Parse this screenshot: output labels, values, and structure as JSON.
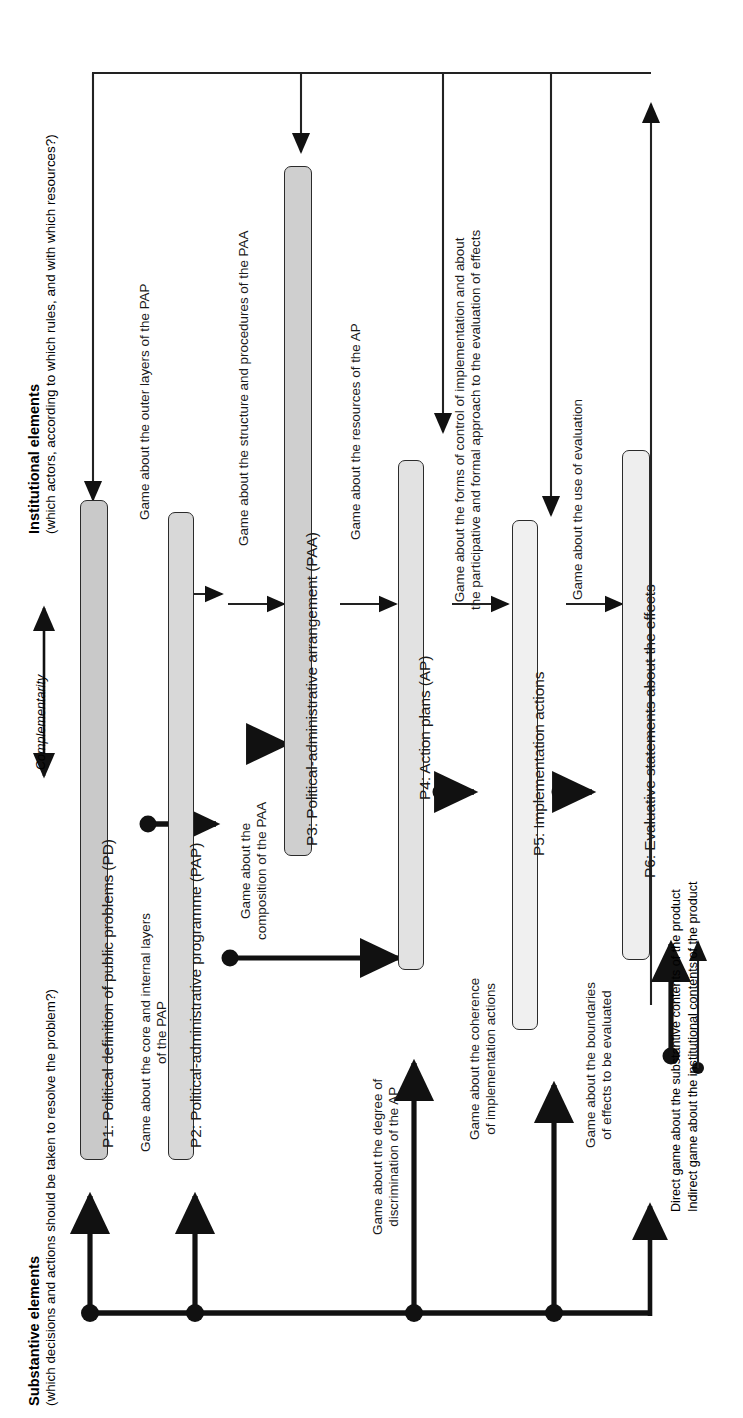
{
  "figure": {
    "orientation": "rotated-90-ccw",
    "top_axis_label_bold": "Institutional elements",
    "top_axis_label_sub": "(which actors, according to which rules, and with which resources?)",
    "bottom_axis_label_bold": "Substantive elements",
    "bottom_axis_label_sub": "(which decisions and actions should be taken to resolve the problem?)",
    "complementarity_label": "Complementarity"
  },
  "colors": {
    "box_fill_dark": "#c9c9c9",
    "box_fill_mid": "#dcdcdc",
    "box_fill_light": "#ededed",
    "box_fill_lighter": "#f4f4f4",
    "stroke": "#2b2b2b",
    "text": "#1a1a1a",
    "background": "#ffffff"
  },
  "boxes": [
    {
      "id": "P1",
      "label": "P1: Political definition of public problems (PD)",
      "fill": "#c9c9c9"
    },
    {
      "id": "P2",
      "label": "P2: Political-administrative programme (PAP)",
      "fill": "#d8d8d8"
    },
    {
      "id": "P3",
      "label": "P3: Political-administrative arrangement (PAA)",
      "fill": "#cfcfcf"
    },
    {
      "id": "P4",
      "label": "P4: Action plans (AP)",
      "fill": "#e2e2e2"
    },
    {
      "id": "P5",
      "label": "P5: Implementation actions",
      "fill": "#f0f0f0"
    },
    {
      "id": "P6",
      "label": "P6: Evaluative statements about the effects",
      "fill": "#eeeeee"
    }
  ],
  "game_labels": [
    {
      "id": "g1",
      "lines": [
        "Game about the core and internal layers",
        "of the PAP"
      ]
    },
    {
      "id": "g2",
      "lines": [
        "Game about the outer layers of the PAP"
      ]
    },
    {
      "id": "g3",
      "lines": [
        "Game about the",
        "composition of the PAA"
      ]
    },
    {
      "id": "g4",
      "lines": [
        "Game about the structure and procedures of the PAA"
      ]
    },
    {
      "id": "g5",
      "lines": [
        "Game about the resources of the AP"
      ]
    },
    {
      "id": "g6",
      "lines": [
        "Game about the degree of",
        "discrimination of the AP"
      ]
    },
    {
      "id": "g7",
      "lines": [
        "Game about the forms of control of implementation and about",
        "the participative and formal approach to the evaluation of effects"
      ]
    },
    {
      "id": "g8",
      "lines": [
        "Game about the coherence",
        "of implementation actions"
      ]
    },
    {
      "id": "g9",
      "lines": [
        "Game about the boundaries",
        "of effects to be evaluated"
      ]
    },
    {
      "id": "g10",
      "lines": [
        "Game about the use of evaluation"
      ]
    }
  ],
  "legend": {
    "direct": "Direct game about the substantive contents of the product",
    "indirect": "Indirect game about the institutional contents of the product"
  }
}
